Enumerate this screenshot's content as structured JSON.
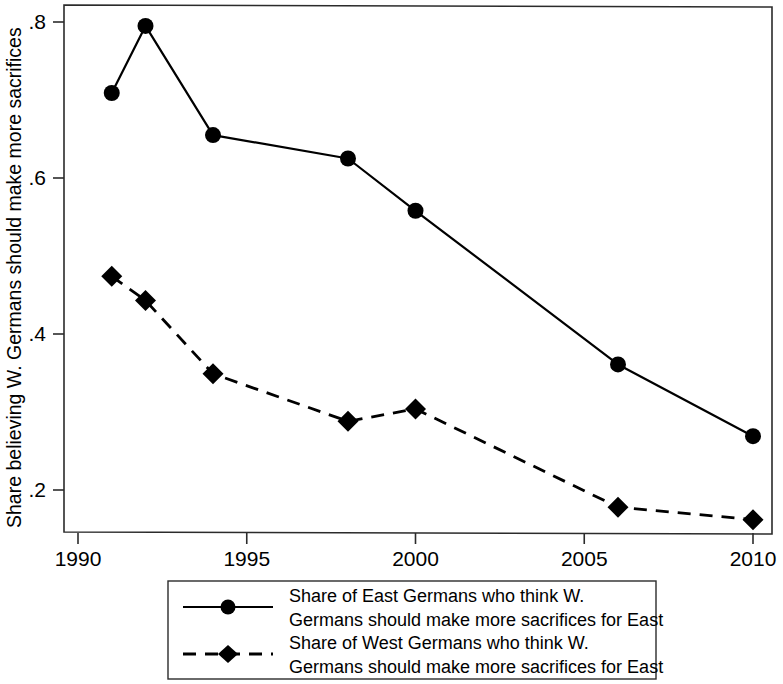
{
  "chart_data": {
    "type": "line",
    "title": "",
    "xlabel": "",
    "ylabel": "Share believing W. Germans should make more sacrifices",
    "xlim": [
      1990,
      2011.2
    ],
    "ylim": [
      0.143,
      0.817
    ],
    "grid": false,
    "legend_position": "bottom",
    "x_ticks": [
      "1990",
      "1995",
      "2000",
      "2005",
      "2010"
    ],
    "x_tick_values": [
      1990,
      1995,
      2000,
      2005,
      2010
    ],
    "y_ticks": [
      ".8",
      ".6",
      ".4",
      ".2"
    ],
    "y_tick_values": [
      0.8,
      0.6,
      0.4,
      0.2
    ],
    "series": [
      {
        "name": "Share of East Germans who think W. Germans should make more sacrifices for East",
        "marker": "circle",
        "linestyle": "solid",
        "color": "#000000",
        "x": [
          1991,
          1992,
          1994,
          1998,
          2000,
          2006,
          2010
        ],
        "values": [
          0.709,
          0.795,
          0.655,
          0.625,
          0.558,
          0.361,
          0.269
        ]
      },
      {
        "name": "Share of West Germans who think W. Germans should make more sacrifices for East",
        "marker": "diamond",
        "linestyle": "dashed",
        "color": "#000000",
        "x": [
          1991,
          1992,
          1994,
          1998,
          2000,
          2006,
          2010
        ],
        "values": [
          0.474,
          0.443,
          0.349,
          0.288,
          0.304,
          0.178,
          0.162
        ]
      }
    ]
  },
  "axis": {
    "y_title": "Share believing W. Germans should make more sacrifices"
  },
  "legend": {
    "entries": [
      {
        "line1": "Share of East Germans who think W.",
        "line2": "Germans should make more sacrifices for East",
        "marker": "circle",
        "linestyle": "solid"
      },
      {
        "line1": "Share of West Germans who think W.",
        "line2": "Germans should make more sacrifices for East",
        "marker": "diamond",
        "linestyle": "dashed"
      }
    ]
  }
}
